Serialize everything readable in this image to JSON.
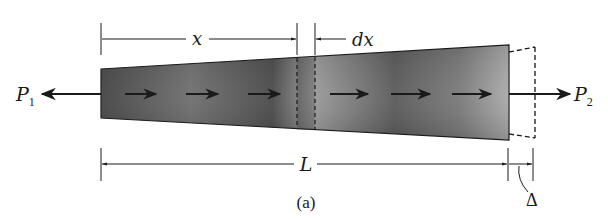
{
  "figure": {
    "caption": "(a)",
    "colors": {
      "bar_dark": "#3a3a3a",
      "bar_light": "#b0b0b0",
      "line": "#1a1a1a",
      "background": "#ffffff"
    }
  },
  "labels": {
    "x": "x",
    "dx": "dx",
    "L": "L",
    "delta": "Δ",
    "P1_main": "P",
    "P1_sub": "1",
    "P2_main": "P",
    "P2_sub": "2",
    "caption": "(a)"
  },
  "bar": {
    "left_x": 101,
    "right_x": 509,
    "left_top": 69,
    "left_bottom": 118,
    "right_top": 45,
    "right_bottom": 140,
    "internal_arrows": 6,
    "element_dx": {
      "x_start": 297,
      "x_end": 315
    }
  },
  "deformed_outline": {
    "extension_end_x": 535,
    "style": "dashed"
  },
  "dimensions": {
    "x": {
      "from": 101,
      "to": 297,
      "y": 39
    },
    "dx": {
      "tick_x": 315,
      "y": 39
    },
    "L": {
      "from": 101,
      "to": 508,
      "y": 164
    },
    "delta": {
      "from": 508,
      "to": 533,
      "y": 164
    }
  },
  "loads": [
    {
      "name": "P1",
      "direction": "left",
      "from_x": 101,
      "to_x": 45,
      "y": 94
    },
    {
      "name": "P2",
      "direction": "right",
      "from_x": 509,
      "to_x": 568,
      "y": 94
    }
  ]
}
